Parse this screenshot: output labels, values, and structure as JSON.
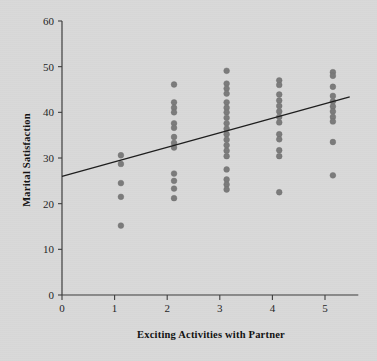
{
  "chart_data": {
    "type": "scatter",
    "title": "",
    "xlabel": "Exciting Activities with Partner",
    "ylabel": "Marital Satisfaction",
    "xlim": [
      0,
      5.5
    ],
    "ylim": [
      0,
      60
    ],
    "xticks": [
      0,
      1,
      2,
      3,
      4,
      5
    ],
    "xtick_labels": [
      "0",
      "1",
      "2",
      "3",
      "4",
      "5"
    ],
    "yticks": [
      0,
      10,
      20,
      30,
      40,
      50,
      60
    ],
    "ytick_labels": [
      "0",
      "10",
      "20",
      "30",
      "40",
      "50",
      "60"
    ],
    "grid": false,
    "legend": "none",
    "point_color": "#7b7b7b",
    "line_color": "#1d1d1d",
    "background_color": "#d9d9d9",
    "points": [
      {
        "x": 1.12,
        "y": 30.6
      },
      {
        "x": 1.12,
        "y": 28.7
      },
      {
        "x": 1.12,
        "y": 24.5
      },
      {
        "x": 1.12,
        "y": 21.5
      },
      {
        "x": 1.12,
        "y": 15.2
      },
      {
        "x": 2.13,
        "y": 46.1
      },
      {
        "x": 2.13,
        "y": 42.2
      },
      {
        "x": 2.13,
        "y": 41.0
      },
      {
        "x": 2.13,
        "y": 40.0
      },
      {
        "x": 2.13,
        "y": 37.6
      },
      {
        "x": 2.13,
        "y": 36.6
      },
      {
        "x": 2.13,
        "y": 34.6
      },
      {
        "x": 2.13,
        "y": 33.3
      },
      {
        "x": 2.13,
        "y": 32.3
      },
      {
        "x": 2.13,
        "y": 26.6
      },
      {
        "x": 2.13,
        "y": 25.0
      },
      {
        "x": 2.13,
        "y": 23.3
      },
      {
        "x": 2.13,
        "y": 21.2
      },
      {
        "x": 3.13,
        "y": 49.1
      },
      {
        "x": 3.13,
        "y": 46.3
      },
      {
        "x": 3.13,
        "y": 45.2
      },
      {
        "x": 3.13,
        "y": 44.1
      },
      {
        "x": 3.13,
        "y": 42.2
      },
      {
        "x": 3.13,
        "y": 41.0
      },
      {
        "x": 3.13,
        "y": 40.0
      },
      {
        "x": 3.13,
        "y": 38.8
      },
      {
        "x": 3.13,
        "y": 37.6
      },
      {
        "x": 3.13,
        "y": 36.4
      },
      {
        "x": 3.13,
        "y": 35.2
      },
      {
        "x": 3.13,
        "y": 34.0
      },
      {
        "x": 3.13,
        "y": 32.8
      },
      {
        "x": 3.13,
        "y": 31.6
      },
      {
        "x": 3.13,
        "y": 30.4
      },
      {
        "x": 3.13,
        "y": 27.5
      },
      {
        "x": 3.13,
        "y": 25.3
      },
      {
        "x": 3.13,
        "y": 24.2
      },
      {
        "x": 3.13,
        "y": 23.1
      },
      {
        "x": 4.13,
        "y": 47.0
      },
      {
        "x": 4.13,
        "y": 46.0
      },
      {
        "x": 4.13,
        "y": 43.9
      },
      {
        "x": 4.13,
        "y": 42.6
      },
      {
        "x": 4.13,
        "y": 41.4
      },
      {
        "x": 4.13,
        "y": 40.2
      },
      {
        "x": 4.13,
        "y": 39.0
      },
      {
        "x": 4.13,
        "y": 37.8
      },
      {
        "x": 4.13,
        "y": 35.2
      },
      {
        "x": 4.13,
        "y": 34.1
      },
      {
        "x": 4.13,
        "y": 31.7
      },
      {
        "x": 4.13,
        "y": 30.4
      },
      {
        "x": 4.13,
        "y": 22.5
      },
      {
        "x": 5.15,
        "y": 48.8
      },
      {
        "x": 5.15,
        "y": 48.0
      },
      {
        "x": 5.15,
        "y": 45.6
      },
      {
        "x": 5.15,
        "y": 43.6
      },
      {
        "x": 5.15,
        "y": 42.4
      },
      {
        "x": 5.15,
        "y": 41.3
      },
      {
        "x": 5.15,
        "y": 40.2
      },
      {
        "x": 5.15,
        "y": 39.0
      },
      {
        "x": 5.15,
        "y": 38.0
      },
      {
        "x": 5.15,
        "y": 33.5
      },
      {
        "x": 5.15,
        "y": 26.2
      }
    ],
    "fit_line": {
      "x0": 0.0,
      "y0": 26.0,
      "x1": 5.47,
      "y1": 43.4
    }
  }
}
